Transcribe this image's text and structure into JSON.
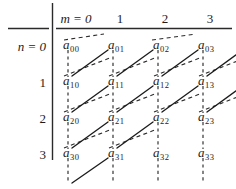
{
  "figure": {
    "name": "matrix-diagonal-traversal-diagram",
    "background": "#ffffff",
    "ink": "#1c1c1c",
    "width": 236,
    "height": 189
  },
  "axes": {
    "column_axis_label": "m = 0",
    "column_axis_symbol": "m",
    "column_headers": [
      "m = 0",
      "1",
      "2",
      "3"
    ],
    "column_header_rest": [
      "1",
      "2",
      "3"
    ],
    "row_axis_label": "n = 0",
    "row_axis_symbol": "n",
    "row_headers": [
      "n = 0",
      "1",
      "2",
      "3"
    ],
    "row_header_rest": [
      "1",
      "2",
      "3"
    ]
  },
  "matrix": {
    "rows": 4,
    "cols": 4,
    "cells": [
      [
        {
          "base": "a",
          "sub": "00"
        },
        {
          "base": "a",
          "sub": "01"
        },
        {
          "base": "a",
          "sub": "02"
        },
        {
          "base": "a",
          "sub": "03"
        }
      ],
      [
        {
          "base": "a",
          "sub": "10"
        },
        {
          "base": "a",
          "sub": "11"
        },
        {
          "base": "a",
          "sub": "12"
        },
        {
          "base": "a",
          "sub": "13"
        }
      ],
      [
        {
          "base": "a",
          "sub": "20"
        },
        {
          "base": "a",
          "sub": "21"
        },
        {
          "base": "a",
          "sub": "22"
        },
        {
          "base": "a",
          "sub": "23"
        }
      ],
      [
        {
          "base": "a",
          "sub": "30"
        },
        {
          "base": "a",
          "sub": "31"
        },
        {
          "base": "a",
          "sub": "32"
        },
        {
          "base": "a",
          "sub": "33"
        }
      ]
    ]
  },
  "geometry": {
    "col_x": [
      68,
      113,
      158,
      203
    ],
    "row_y": [
      46,
      82,
      118,
      154
    ],
    "divider_x": 52,
    "divider_top": 3,
    "divider_bottom": 160,
    "rule_y": 28,
    "rule_left": 8,
    "rule_right": 232
  },
  "legend": {
    "solid_line_meaning": "forward diagonal scan segment",
    "dashed_line_meaning": "diagonal return path",
    "vertical_dashed_meaning": "column continuation connector"
  }
}
